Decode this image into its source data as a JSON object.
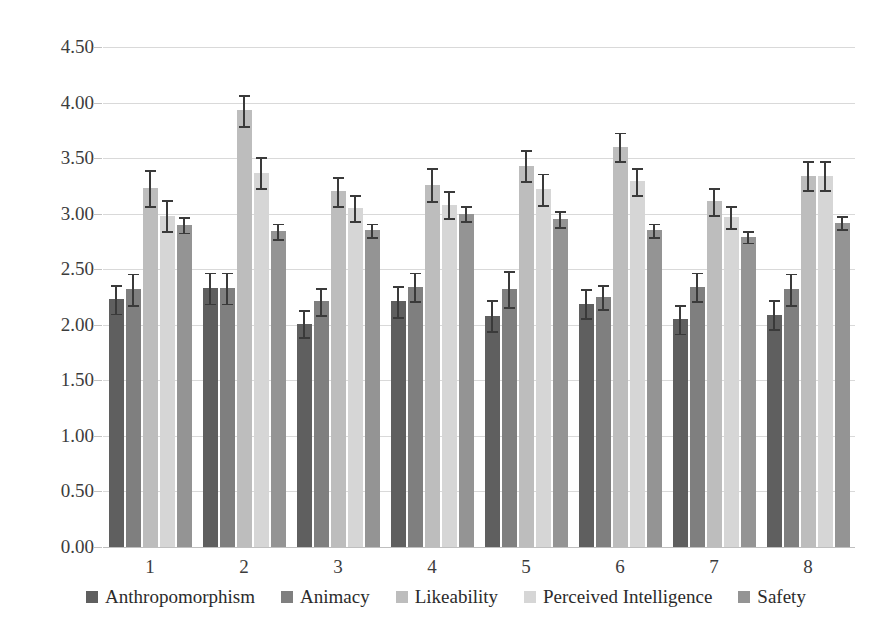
{
  "chart_data": {
    "type": "bar",
    "title": "",
    "xlabel": "",
    "ylabel": "",
    "ylim": [
      0,
      4.5
    ],
    "ytick_values": [
      0.0,
      0.5,
      1.0,
      1.5,
      2.0,
      2.5,
      3.0,
      3.5,
      4.0,
      4.5
    ],
    "ytick_labels": [
      "0.00",
      "0.50",
      "1.00",
      "1.50",
      "2.00",
      "2.50",
      "3.00",
      "3.50",
      "4.00",
      "4.50"
    ],
    "categories": [
      "1",
      "2",
      "3",
      "4",
      "5",
      "6",
      "7",
      "8"
    ],
    "grid": true,
    "legend_position": "bottom",
    "error_bars": "symmetric",
    "series": [
      {
        "name": "Anthropomorphism",
        "color": "#5f5f5f",
        "values": [
          2.23,
          2.33,
          2.01,
          2.21,
          2.08,
          2.19,
          2.05,
          2.09
        ],
        "errors": [
          0.13,
          0.14,
          0.12,
          0.14,
          0.14,
          0.13,
          0.13,
          0.13
        ]
      },
      {
        "name": "Animacy",
        "color": "#7f7f7f",
        "values": [
          2.32,
          2.33,
          2.21,
          2.34,
          2.32,
          2.25,
          2.34,
          2.32
        ],
        "errors": [
          0.14,
          0.14,
          0.12,
          0.13,
          0.16,
          0.11,
          0.13,
          0.14
        ]
      },
      {
        "name": "Likeability",
        "color": "#bdbdbd",
        "values": [
          3.23,
          3.93,
          3.2,
          3.26,
          3.43,
          3.6,
          3.11,
          3.34
        ],
        "errors": [
          0.16,
          0.14,
          0.13,
          0.15,
          0.14,
          0.13,
          0.12,
          0.13
        ]
      },
      {
        "name": "Perceived Intelligence",
        "color": "#d6d6d6",
        "values": [
          2.98,
          3.37,
          3.05,
          3.08,
          3.22,
          3.29,
          2.97,
          3.34
        ],
        "errors": [
          0.14,
          0.14,
          0.12,
          0.12,
          0.14,
          0.12,
          0.1,
          0.13
        ]
      },
      {
        "name": "Safety",
        "color": "#949494",
        "values": [
          2.9,
          2.84,
          2.85,
          3.0,
          2.95,
          2.85,
          2.79,
          2.92
        ],
        "errors": [
          0.07,
          0.07,
          0.06,
          0.07,
          0.07,
          0.06,
          0.05,
          0.06
        ]
      }
    ]
  }
}
